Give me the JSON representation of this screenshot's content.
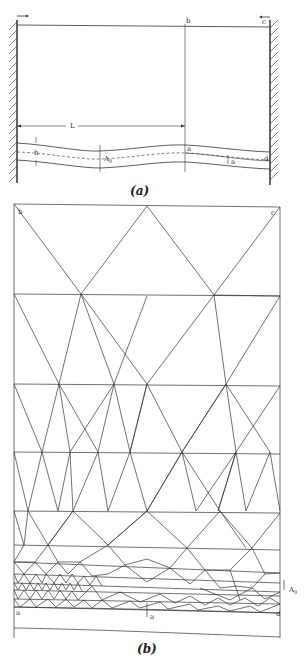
{
  "figure_a": {
    "caption": "(a)",
    "labels": {
      "b": "b",
      "c": "c",
      "L": "L",
      "h": "h",
      "A0": "A",
      "A0_sub": "0",
      "a_center": "a",
      "a_right": "a",
      "d": "d"
    }
  },
  "figure_b": {
    "caption": "(b)",
    "labels": {
      "b": "b",
      "c": "c",
      "a": "a",
      "d": "d",
      "a_bottom": "a",
      "A0": "A",
      "A0_sub": "0"
    }
  },
  "colors": {
    "line": "#333333",
    "wall_hatch": "#444444",
    "background": "#ffffff"
  }
}
